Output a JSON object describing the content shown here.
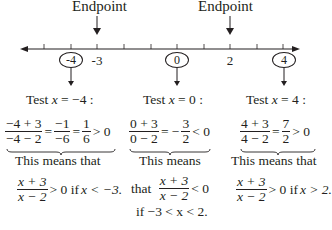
{
  "number_line": {
    "min": -5,
    "max": 4,
    "tick_values": [
      -5,
      -4,
      -3,
      -2,
      -1,
      0,
      1,
      2,
      3,
      4
    ],
    "labeled_ticks": [
      {
        "value": "-4",
        "circled": true
      },
      {
        "value": "-3",
        "circled": false
      },
      {
        "value": "0",
        "circled": true
      },
      {
        "value": "2",
        "circled": false
      },
      {
        "value": "4",
        "circled": true
      }
    ],
    "endpoints": [
      {
        "label": "Endpoint",
        "value": "-3"
      },
      {
        "label": "Endpoint",
        "value": "2"
      }
    ]
  },
  "tests": [
    {
      "heading_prefix": "Test ",
      "var": "x",
      "heading_suffix": " = −4 :",
      "num": "−4 + 3",
      "den": "−4 − 2",
      "mid_num": "−1",
      "mid_den": "−6",
      "res_num": "1",
      "res_den": "6",
      "comparison": "> 0",
      "means_line1": "This means that",
      "means_line2": "",
      "conclusion_num": "x + 3",
      "conclusion_den": "x − 2",
      "conclusion_cmp": "> 0 if ",
      "conclusion_cond": "x < −3."
    },
    {
      "heading_prefix": "Test ",
      "var": "x",
      "heading_suffix": " = 0 :",
      "num": "0 + 3",
      "den": "0 − 2",
      "mid_prefix": "= −",
      "res_num": "3",
      "res_den": "2",
      "comparison": "< 0",
      "means_line1": "This means",
      "means_line2": "that",
      "conclusion_num": "x + 3",
      "conclusion_den": "x − 2",
      "conclusion_cmp": "< 0",
      "conclusion_cond": "if −3 < x < 2."
    },
    {
      "heading_prefix": "Test ",
      "var": "x",
      "heading_suffix": " = 4 :",
      "num": "4 + 3",
      "den": "4 − 2",
      "res_num": "7",
      "res_den": "2",
      "comparison": "> 0",
      "means_line1": "This means that",
      "means_line2": "",
      "conclusion_num": "x + 3",
      "conclusion_den": "x − 2",
      "conclusion_cmp": "> 0 if ",
      "conclusion_cond": "x > 2."
    }
  ]
}
